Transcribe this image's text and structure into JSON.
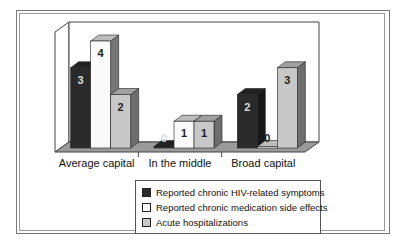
{
  "chart_data": {
    "type": "bar",
    "style": "3d-clustered",
    "title": "",
    "xlabel": "",
    "ylabel": "",
    "categories": [
      "Average capital",
      "In the middle",
      "Broad capital"
    ],
    "series": [
      {
        "name": "Reported chronic HIV-related symptoms",
        "values": [
          3,
          0,
          2
        ],
        "color": "#2a2a2a"
      },
      {
        "name": "Reported chronic medication side effects",
        "values": [
          4,
          1,
          0
        ],
        "color": "#fafafa"
      },
      {
        "name": "Acute hospitalizations",
        "values": [
          2,
          1,
          3
        ],
        "color": "#c8c8c8"
      }
    ],
    "ylim": [
      0,
      4
    ],
    "grid": false,
    "data_labels": true,
    "legend_position": "bottom"
  }
}
